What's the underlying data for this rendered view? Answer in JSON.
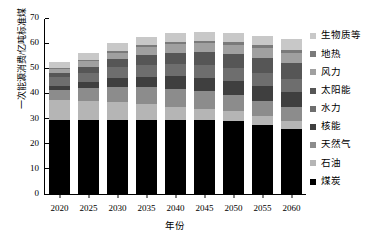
{
  "chart_data": {
    "type": "bar",
    "stacked": true,
    "title": "",
    "xlabel": "年份",
    "ylabel": "一次能源消费/亿吨标准煤",
    "categories": [
      "2020",
      "2025",
      "2030",
      "2035",
      "2040",
      "2045",
      "2050",
      "2055",
      "2060"
    ],
    "ylim": [
      0,
      70
    ],
    "yticks": [
      0,
      10,
      20,
      30,
      40,
      50,
      60,
      70
    ],
    "grid": false,
    "legend_position": "right",
    "series": [
      {
        "name": "煤炭",
        "color": "#000000",
        "values": [
          29.5,
          29.5,
          29.5,
          29.5,
          29.5,
          29.3,
          29.0,
          27.5,
          25.8
        ]
      },
      {
        "name": "石油",
        "color": "#b5b5b5",
        "values": [
          8.0,
          7.5,
          7.0,
          6.2,
          5.3,
          4.6,
          4.0,
          3.5,
          3.2
        ]
      },
      {
        "name": "天然气",
        "color": "#8c8c8c",
        "values": [
          4.0,
          5.0,
          6.2,
          6.8,
          7.0,
          7.0,
          6.5,
          6.0,
          5.5
        ]
      },
      {
        "name": "核能",
        "color": "#3f3f3f",
        "values": [
          1.5,
          2.4,
          3.4,
          4.2,
          5.0,
          5.4,
          5.6,
          5.8,
          6.0
        ]
      },
      {
        "name": "水力",
        "color": "#6e6e6e",
        "values": [
          3.5,
          3.9,
          4.3,
          4.6,
          4.9,
          5.1,
          5.2,
          5.3,
          5.4
        ]
      },
      {
        "name": "太阳能",
        "color": "#565656",
        "values": [
          1.5,
          2.3,
          3.2,
          4.0,
          4.6,
          5.1,
          5.5,
          6.0,
          6.3
        ]
      },
      {
        "name": "风力",
        "color": "#a0a0a0",
        "values": [
          1.6,
          2.2,
          2.7,
          3.0,
          3.2,
          3.4,
          3.6,
          3.8,
          4.0
        ]
      },
      {
        "name": "地热",
        "color": "#7a7a7a",
        "values": [
          0.6,
          0.7,
          0.8,
          0.9,
          1.0,
          1.1,
          1.1,
          1.2,
          1.2
        ]
      },
      {
        "name": "生物质等",
        "color": "#c8c8c8",
        "values": [
          2.3,
          2.5,
          2.9,
          3.3,
          3.5,
          3.6,
          3.7,
          3.9,
          4.1
        ]
      }
    ]
  },
  "legend": {
    "items": [
      {
        "label": "生物质等",
        "color": "#c8c8c8"
      },
      {
        "label": "地热",
        "color": "#7a7a7a"
      },
      {
        "label": "风力",
        "color": "#a0a0a0"
      },
      {
        "label": "太阳能",
        "color": "#565656"
      },
      {
        "label": "水力",
        "color": "#6e6e6e"
      },
      {
        "label": "核能",
        "color": "#3f3f3f"
      },
      {
        "label": "天然气",
        "color": "#8c8c8c"
      },
      {
        "label": "石油",
        "color": "#b5b5b5"
      },
      {
        "label": "煤炭",
        "color": "#000000"
      }
    ]
  }
}
